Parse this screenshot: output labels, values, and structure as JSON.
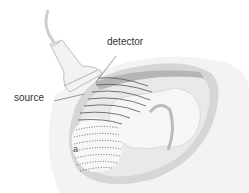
{
  "diagram": {
    "labels": {
      "detector": "detector",
      "source": "source",
      "edge_fragment": "a"
    },
    "colors": {
      "background": "#ffffff",
      "uterus_outer": "#d9d9d9",
      "uterus_inner": "#bdbdbd",
      "fluid": "#e8e8e8",
      "fetus": "#f4f4f4",
      "probe": "#f2f2f2",
      "waves": "#555555",
      "text": "#333333"
    }
  }
}
